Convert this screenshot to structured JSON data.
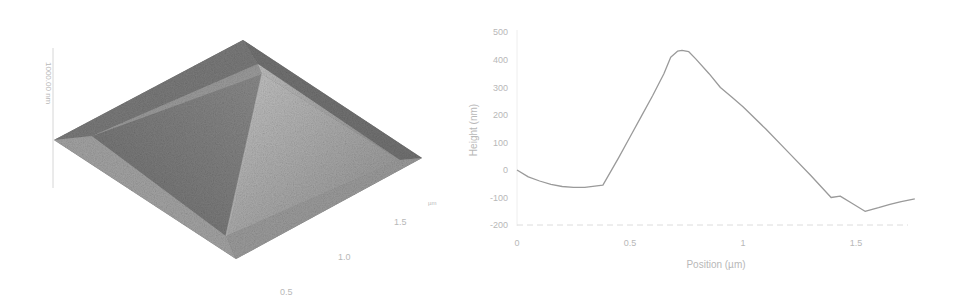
{
  "chart_data": [
    {
      "type": "surface3d",
      "title": "",
      "description": "3D AFM topography of a pyramid-shaped structure on a flat substrate",
      "z_axis_label": "1000.00 nm",
      "xy_axis_unit": "µm",
      "xy_tick_labels": [
        "0.5",
        "1.0",
        "1.5"
      ],
      "colormap": "grayscale",
      "colors": {
        "dark": "#6b6b6b",
        "mid": "#8c8c8c",
        "light": "#bdbdbd",
        "rim": "#9a9a9a"
      }
    },
    {
      "type": "line",
      "title": "",
      "xlabel": "Position (µm)",
      "ylabel": "Height (nm)",
      "xlim": [
        0,
        1.8
      ],
      "ylim": [
        -200,
        500
      ],
      "x_ticks": [
        "0",
        "0.5",
        "1",
        "1.5"
      ],
      "y_ticks": [
        "500",
        "400",
        "300",
        "200",
        "100",
        "0",
        "-100",
        "-200"
      ],
      "grid": false,
      "legend": null,
      "series": [
        {
          "name": "Height profile",
          "color": "#9a9a9a",
          "x": [
            0,
            0.05,
            0.1,
            0.15,
            0.2,
            0.25,
            0.3,
            0.38,
            0.45,
            0.5,
            0.55,
            0.6,
            0.65,
            0.68,
            0.71,
            0.73,
            0.76,
            0.79,
            0.85,
            0.9,
            0.95,
            1.0,
            1.1,
            1.2,
            1.3,
            1.39,
            1.43,
            1.48,
            1.54,
            1.6,
            1.65,
            1.7,
            1.76
          ],
          "y": [
            0,
            -25,
            -40,
            -52,
            -60,
            -63,
            -63,
            -55,
            45,
            120,
            195,
            270,
            350,
            410,
            432,
            435,
            430,
            405,
            350,
            300,
            265,
            230,
            150,
            65,
            -20,
            -100,
            -95,
            -120,
            -150,
            -137,
            -125,
            -115,
            -105
          ]
        }
      ]
    }
  ],
  "left_panel": {
    "z_label": "1000.00 nm",
    "unit_label": "µm",
    "tick_05": "0.5",
    "tick_10": "1.0",
    "tick_15": "1.5"
  },
  "right_panel": {
    "xlabel": "Position (µm)",
    "ylabel": "Height (nm)",
    "yticks": [
      "500",
      "400",
      "300",
      "200",
      "100",
      "0",
      "-100",
      "-200"
    ],
    "xticks": [
      "0",
      "0.5",
      "1",
      "1.5"
    ]
  }
}
